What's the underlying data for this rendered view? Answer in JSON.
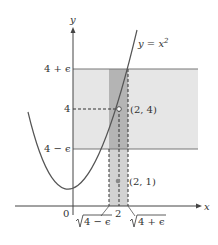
{
  "figure": {
    "axes": {
      "x_label": "x",
      "y_label": "y",
      "origin_label": "0"
    },
    "curve": {
      "label_prefix": "y = x",
      "label_exp": "2"
    },
    "y_ticks": {
      "upper": "4 + ϵ",
      "middle": "4",
      "lower": "4 − ϵ"
    },
    "x_ticks": {
      "left_root": "4 − ϵ",
      "center": "2",
      "right_root": "4 + ϵ"
    },
    "points": {
      "open_point": "(2, 4)",
      "filled_point": "(2, 1)"
    },
    "colors": {
      "band_light": "#e6e6e6",
      "band_dark": "#b4b4b4",
      "band_mid": "#cdcdcd",
      "curve": "#555555",
      "axis": "#444444"
    }
  }
}
